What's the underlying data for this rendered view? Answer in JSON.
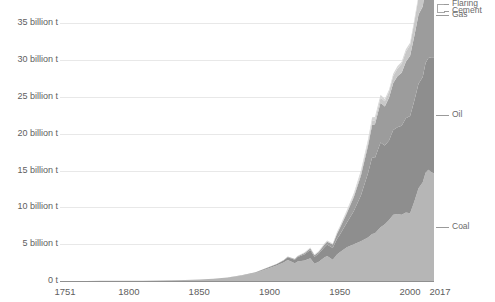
{
  "chart_data": {
    "type": "area",
    "stacked": true,
    "title": "",
    "subtitle": "",
    "xlabel": "",
    "ylabel": "",
    "xlim": [
      1751,
      2017
    ],
    "ylim": [
      0,
      36
    ],
    "grid": true,
    "legend_position": "right-inline-labels",
    "units": "billion tonnes CO2",
    "x_tick_labels": [
      "1751",
      "1800",
      "1850",
      "1900",
      "1950",
      "2000",
      "2017"
    ],
    "x_ticks": [
      1751,
      1800,
      1850,
      1900,
      1950,
      2000,
      2017
    ],
    "y_tick_labels": [
      "0 t",
      "5 billion t",
      "10 billion t",
      "15 billion t",
      "20 billion t",
      "25 billion t",
      "30 billion t",
      "35 billion t"
    ],
    "y_ticks": [
      0,
      5,
      10,
      15,
      20,
      25,
      30,
      35
    ],
    "colors": {
      "coal": "#b6b6b6",
      "oil": "#8e8e8e",
      "gas": "#9c9c9c",
      "cement": "#c8c8c8",
      "flaring": "#d6d6d6",
      "gridline": "#e8e8e8",
      "axis": "#8f8f8f",
      "text": "#5e5e5e",
      "leader": "#9a9a9a"
    },
    "x": [
      1751,
      1760,
      1770,
      1780,
      1790,
      1800,
      1810,
      1820,
      1830,
      1840,
      1850,
      1860,
      1870,
      1880,
      1890,
      1900,
      1905,
      1910,
      1913,
      1918,
      1920,
      1925,
      1929,
      1932,
      1935,
      1939,
      1941,
      1945,
      1948,
      1950,
      1955,
      1960,
      1965,
      1970,
      1973,
      1975,
      1979,
      1982,
      1985,
      1988,
      1991,
      1994,
      1997,
      2000,
      2003,
      2006,
      2009,
      2011,
      2013,
      2015,
      2017
    ],
    "series": [
      {
        "name": "Coal",
        "label": "Coal",
        "color": "#b6b6b6",
        "values": [
          0.01,
          0.01,
          0.01,
          0.02,
          0.03,
          0.03,
          0.05,
          0.07,
          0.1,
          0.15,
          0.2,
          0.31,
          0.46,
          0.72,
          1.1,
          1.78,
          2.1,
          2.5,
          2.85,
          2.4,
          2.65,
          2.8,
          3.1,
          2.35,
          2.6,
          3.2,
          3.4,
          2.9,
          3.6,
          3.9,
          4.6,
          5.0,
          5.4,
          5.9,
          6.4,
          6.5,
          7.3,
          7.7,
          8.3,
          9.0,
          9.1,
          9.0,
          9.3,
          9.2,
          10.8,
          12.6,
          13.4,
          14.7,
          15.1,
          14.8,
          14.6
        ]
      },
      {
        "name": "Oil",
        "label": "Oil",
        "color": "#8e8e8e",
        "values": [
          0,
          0,
          0,
          0,
          0,
          0,
          0,
          0,
          0,
          0,
          0,
          0.01,
          0.02,
          0.04,
          0.07,
          0.12,
          0.18,
          0.28,
          0.38,
          0.5,
          0.62,
          0.85,
          1.1,
          0.95,
          1.1,
          1.4,
          1.55,
          1.6,
          2.1,
          2.4,
          3.3,
          4.5,
          6.2,
          8.7,
          10.4,
          10.2,
          11.5,
          10.7,
          10.8,
          11.5,
          11.8,
          12.1,
          12.8,
          13.2,
          13.7,
          14.2,
          14.3,
          14.9,
          15.2,
          15.6,
          15.8
        ]
      },
      {
        "name": "Gas",
        "label": "Gas",
        "color": "#9c9c9c",
        "values": [
          0,
          0,
          0,
          0,
          0,
          0,
          0,
          0,
          0,
          0,
          0,
          0,
          0,
          0.01,
          0.01,
          0.02,
          0.03,
          0.05,
          0.07,
          0.08,
          0.1,
          0.15,
          0.22,
          0.2,
          0.24,
          0.32,
          0.38,
          0.45,
          0.7,
          0.85,
          1.3,
          1.9,
          2.7,
          3.7,
          4.4,
          4.6,
          5.4,
          5.3,
          5.8,
          6.4,
          6.9,
          7.2,
          7.7,
          8.2,
          8.8,
          9.4,
          9.6,
          10.4,
          10.8,
          11.2,
          11.6
        ]
      },
      {
        "name": "Cement",
        "label": "Cement",
        "color": "#c8c8c8",
        "values": [
          0,
          0,
          0,
          0,
          0,
          0,
          0,
          0,
          0,
          0,
          0,
          0,
          0,
          0,
          0.01,
          0.01,
          0.01,
          0.02,
          0.03,
          0.02,
          0.03,
          0.05,
          0.07,
          0.04,
          0.06,
          0.08,
          0.08,
          0.06,
          0.1,
          0.12,
          0.18,
          0.25,
          0.33,
          0.45,
          0.55,
          0.55,
          0.7,
          0.72,
          0.8,
          0.95,
          1.05,
          1.2,
          1.35,
          1.45,
          1.9,
          2.3,
          2.6,
          3.0,
          3.2,
          3.1,
          3.0
        ]
      },
      {
        "name": "Flaring",
        "label": "Flaring",
        "color": "#d6d6d6",
        "values": [
          0,
          0,
          0,
          0,
          0,
          0,
          0,
          0,
          0,
          0,
          0,
          0,
          0,
          0,
          0,
          0,
          0,
          0.01,
          0.01,
          0.02,
          0.02,
          0.04,
          0.06,
          0.05,
          0.06,
          0.08,
          0.09,
          0.1,
          0.14,
          0.16,
          0.22,
          0.3,
          0.38,
          0.45,
          0.48,
          0.42,
          0.4,
          0.32,
          0.28,
          0.3,
          0.32,
          0.3,
          0.32,
          0.3,
          0.32,
          0.34,
          0.34,
          0.36,
          0.38,
          0.38,
          0.4
        ]
      }
    ],
    "total_2017": 36.2,
    "annotations": []
  },
  "axis": {
    "y_labels": [
      {
        "value": 35,
        "text": "35 billion t"
      },
      {
        "value": 30,
        "text": "30 billion t"
      },
      {
        "value": 25,
        "text": "25 billion t"
      },
      {
        "value": 20,
        "text": "20 billion t"
      },
      {
        "value": 15,
        "text": "15 billion t"
      },
      {
        "value": 10,
        "text": "10 billion t"
      },
      {
        "value": 5,
        "text": "5 billion t"
      },
      {
        "value": 0,
        "text": "0 t"
      }
    ],
    "x_labels": [
      {
        "value": 1751,
        "text": "1751"
      },
      {
        "value": 1800,
        "text": "1800"
      },
      {
        "value": 1850,
        "text": "1850"
      },
      {
        "value": 1900,
        "text": "1900"
      },
      {
        "value": 1950,
        "text": "1950"
      },
      {
        "value": 2000,
        "text": "2000"
      },
      {
        "value": 2017,
        "text": "2017"
      }
    ]
  },
  "series_labels": {
    "flaring": "Flaring",
    "cement": "Cement",
    "gas": "Gas",
    "oil": "Oil",
    "coal": "Coal"
  }
}
